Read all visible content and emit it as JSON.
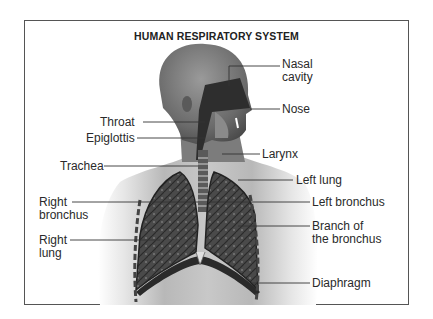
{
  "diagram": {
    "title": "HUMAN RESPIRATORY SYSTEM",
    "labels": {
      "nasal_cavity": [
        "Nasal",
        "cavity"
      ],
      "nose": "Nose",
      "throat": "Throat",
      "epiglottis": "Epiglottis",
      "larynx": "Larynx",
      "trachea": "Trachea",
      "left_lung": "Left lung",
      "right_bronchus": [
        "Right",
        "bronchus"
      ],
      "left_bronchus": "Left bronchus",
      "right_lung": [
        "Right",
        "lung"
      ],
      "branch_of_bronchus": [
        "Branch of",
        "the bronchus"
      ],
      "diaphragm": "Diaphragm"
    },
    "colors": {
      "frame": "#555555",
      "text": "#2a2a2a",
      "skin_dark": "#6e6e6e",
      "skin_light": "#d8d8d8",
      "lung": "#3a3a3a",
      "background": "#ffffff"
    }
  }
}
